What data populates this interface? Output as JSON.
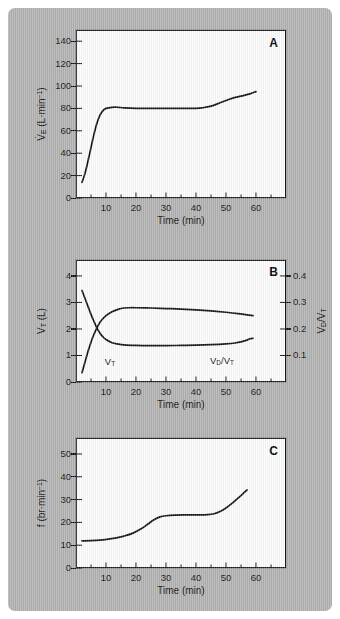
{
  "figure": {
    "background_color": "#b3b3b3",
    "panel_background": "#fdfdfd",
    "curve_color": "#111111"
  },
  "panels": [
    {
      "letter": "A",
      "x_title": "Time (min)",
      "y_title_left": "V̇E (L·min⁻¹)",
      "x_ticks": [
        10,
        20,
        30,
        40,
        50,
        60
      ],
      "y_ticks_left": [
        0,
        20,
        40,
        60,
        80,
        100,
        120,
        140
      ]
    },
    {
      "letter": "B",
      "x_title": "Time (min)",
      "y_title_left": "VT (L)",
      "y_title_right": "VD/VT",
      "x_ticks": [
        10,
        20,
        30,
        40,
        50,
        60
      ],
      "y_ticks_left": [
        0,
        1,
        2,
        3,
        4
      ],
      "y_ticks_right": [
        0.1,
        0.2,
        0.3,
        0.4
      ],
      "curve_labels": [
        "VT",
        "VD/VT"
      ]
    },
    {
      "letter": "C",
      "x_title": "Time (min)",
      "y_title_left": "f (br·min⁻¹)",
      "x_ticks": [
        10,
        20,
        30,
        40,
        50,
        60
      ],
      "y_ticks_left": [
        0,
        10,
        20,
        30,
        40,
        50
      ]
    }
  ],
  "chart_data": [
    {
      "type": "line",
      "panel": "A",
      "title": "A",
      "xlabel": "Time (min)",
      "ylabel": "V̇E (L·min⁻¹)",
      "xlim": [
        0,
        70
      ],
      "ylim": [
        0,
        150
      ],
      "xticks": [
        10,
        20,
        30,
        40,
        50,
        60
      ],
      "yticks": [
        0,
        20,
        40,
        60,
        80,
        100,
        120,
        140
      ],
      "grid": false,
      "legend": null,
      "series": [
        {
          "name": "Minute ventilation",
          "x": [
            2,
            3,
            4,
            5,
            6,
            7,
            8,
            9,
            10,
            12,
            14,
            16,
            20,
            25,
            30,
            35,
            38,
            40,
            42,
            45,
            48,
            50,
            52,
            55,
            58,
            60
          ],
          "y": [
            14,
            22,
            33,
            45,
            57,
            67,
            74,
            78,
            80,
            81,
            81,
            80.5,
            80,
            80,
            80,
            80,
            80,
            80,
            80.5,
            82,
            85,
            87,
            89,
            91,
            93,
            95
          ]
        }
      ]
    },
    {
      "type": "line",
      "panel": "B",
      "title": "B",
      "xlabel": "Time (min)",
      "ylabel": "VT (L)",
      "ylabel_right": "VD/VT",
      "xlim": [
        0,
        70
      ],
      "ylim": [
        0,
        4.6
      ],
      "ylim_right": [
        0,
        0.46
      ],
      "xticks": [
        10,
        20,
        30,
        40,
        50,
        60
      ],
      "yticks": [
        0,
        1,
        2,
        3,
        4
      ],
      "yticks_right": [
        0.1,
        0.2,
        0.3,
        0.4
      ],
      "grid": false,
      "series": [
        {
          "name": "VT",
          "axis": "left",
          "x": [
            2,
            3,
            4,
            5,
            6,
            8,
            10,
            12,
            14,
            16,
            18,
            20,
            25,
            30,
            35,
            40,
            45,
            50,
            54,
            57,
            59
          ],
          "y": [
            0.35,
            0.75,
            1.15,
            1.5,
            1.8,
            2.25,
            2.5,
            2.65,
            2.74,
            2.79,
            2.8,
            2.8,
            2.79,
            2.77,
            2.75,
            2.72,
            2.68,
            2.63,
            2.58,
            2.53,
            2.5
          ]
        },
        {
          "name": "VD/VT",
          "axis": "right",
          "x": [
            2,
            3,
            4,
            5,
            6,
            7,
            8,
            9,
            10,
            12,
            14,
            16,
            20,
            25,
            30,
            35,
            40,
            45,
            50,
            53,
            55,
            57,
            58,
            59
          ],
          "y": [
            0.345,
            0.315,
            0.285,
            0.255,
            0.228,
            0.203,
            0.184,
            0.17,
            0.16,
            0.148,
            0.143,
            0.14,
            0.138,
            0.137,
            0.137,
            0.138,
            0.139,
            0.141,
            0.144,
            0.147,
            0.151,
            0.158,
            0.163,
            0.165
          ]
        }
      ]
    },
    {
      "type": "line",
      "panel": "C",
      "title": "C",
      "xlabel": "Time (min)",
      "ylabel": "f (br·min⁻¹)",
      "xlim": [
        0,
        70
      ],
      "ylim": [
        0,
        57
      ],
      "xticks": [
        10,
        20,
        30,
        40,
        50,
        60
      ],
      "yticks": [
        0,
        10,
        20,
        30,
        40,
        50
      ],
      "grid": false,
      "legend": null,
      "series": [
        {
          "name": "Breathing frequency",
          "x": [
            2,
            5,
            8,
            10,
            13,
            16,
            19,
            22,
            24,
            26,
            28,
            30,
            33,
            36,
            40,
            44,
            46,
            48,
            50,
            52,
            54,
            56,
            57
          ],
          "y": [
            11.9,
            12.0,
            12.2,
            12.5,
            13.1,
            14.0,
            15.3,
            17.4,
            19.3,
            21.2,
            22.4,
            22.9,
            23.2,
            23.3,
            23.3,
            23.4,
            23.8,
            24.8,
            26.3,
            28.3,
            30.6,
            33.0,
            34.2
          ]
        }
      ]
    }
  ]
}
